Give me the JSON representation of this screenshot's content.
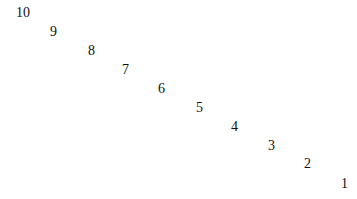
{
  "numbers": [
    {
      "label": "10",
      "x": 16,
      "y": 6
    },
    {
      "label": "9",
      "x": 50,
      "y": 25
    },
    {
      "label": "8",
      "x": 88,
      "y": 44
    },
    {
      "label": "7",
      "x": 122,
      "y": 63
    },
    {
      "label": "6",
      "x": 158,
      "y": 82
    },
    {
      "label": "5",
      "x": 196,
      "y": 101
    },
    {
      "label": "4",
      "x": 231,
      "y": 120
    },
    {
      "label": "3",
      "x": 268,
      "y": 139
    },
    {
      "label": "2",
      "x": 304,
      "y": 157
    },
    {
      "label": "1",
      "x": 341,
      "y": 177
    }
  ]
}
